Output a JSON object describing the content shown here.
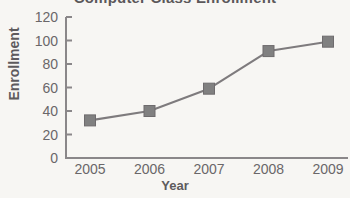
{
  "chart_data": {
    "type": "line",
    "title": "Computer Class Enrollment",
    "xlabel": "Year",
    "ylabel": "Enrollment",
    "categories": [
      "2005",
      "2006",
      "2007",
      "2008",
      "2009"
    ],
    "values": [
      32,
      40,
      59,
      91,
      99
    ],
    "ylim": [
      0,
      120
    ],
    "yticks": [
      "0",
      "20",
      "40",
      "60",
      "80",
      "100",
      "120"
    ],
    "ytick_values": [
      0,
      20,
      40,
      60,
      80,
      100,
      120
    ],
    "grid": false,
    "legend": false,
    "marker": "square",
    "colors": {
      "line": "#7e7b7d",
      "marker": "#808080",
      "marker_edge": "#6e6b6d",
      "axis": "#8a8789",
      "text": "#5e5b5d",
      "tick_text": "#6a6769",
      "background": "#f7f6f3"
    }
  }
}
